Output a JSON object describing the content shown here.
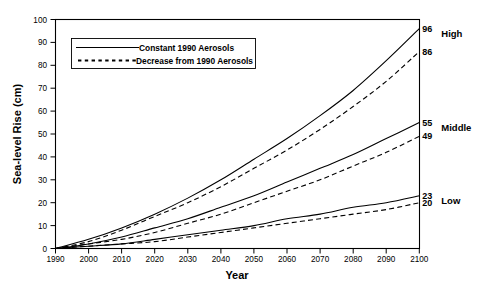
{
  "chart_data": {
    "type": "line",
    "title": "",
    "xlabel": "Year",
    "ylabel": "Sea-level Rise (cm)",
    "xlim": [
      1990,
      2100
    ],
    "ylim": [
      0,
      100
    ],
    "grid": false,
    "legend_position": "upper-left",
    "x": [
      1990,
      2000,
      2010,
      2020,
      2030,
      2040,
      2050,
      2060,
      2070,
      2080,
      2090,
      2100
    ],
    "xticks": [
      "1990",
      "2000",
      "2010",
      "2020",
      "2030",
      "2040",
      "2050",
      "2060",
      "2070",
      "2080",
      "2090",
      "2100"
    ],
    "yticks": [
      "0",
      "10",
      "20",
      "30",
      "40",
      "50",
      "60",
      "70",
      "80",
      "90",
      "100"
    ],
    "series": [
      {
        "name": "High - Constant 1990 Aerosols",
        "scenario": "High",
        "style": "solid",
        "end_value": 96,
        "values": [
          0,
          4,
          9,
          15,
          22,
          30,
          39,
          48,
          58,
          69,
          82,
          96
        ]
      },
      {
        "name": "High - Decrease from 1990 Aerosols",
        "scenario": "High",
        "style": "dashed",
        "end_value": 86,
        "values": [
          0,
          3,
          8,
          14,
          20,
          27,
          35,
          43,
          52,
          62,
          73,
          86
        ]
      },
      {
        "name": "Middle - Constant 1990 Aerosols",
        "scenario": "Middle",
        "style": "solid",
        "end_value": 55,
        "values": [
          0,
          2,
          5,
          9,
          13,
          18,
          23,
          29,
          35,
          41,
          48,
          55
        ]
      },
      {
        "name": "Middle - Decrease from 1990 Aerosols",
        "scenario": "Middle",
        "style": "dashed",
        "end_value": 49,
        "values": [
          0,
          2,
          4,
          7,
          11,
          15,
          20,
          25,
          30,
          36,
          42,
          49
        ]
      },
      {
        "name": "Low - Constant 1990 Aerosols",
        "scenario": "Low",
        "style": "solid",
        "end_value": 23,
        "values": [
          0,
          1,
          2,
          4,
          6,
          8,
          10,
          13,
          15,
          18,
          20,
          23
        ]
      },
      {
        "name": "Low - Decrease from 1990 Aerosols",
        "scenario": "Low",
        "style": "dashed",
        "end_value": 20,
        "values": [
          0,
          1,
          2,
          3,
          5,
          7,
          9,
          11,
          13,
          15,
          17,
          20
        ]
      }
    ],
    "annotations": [
      {
        "label": "High",
        "values": [
          96,
          86
        ]
      },
      {
        "label": "Middle",
        "values": [
          55,
          49
        ]
      },
      {
        "label": "Low",
        "values": [
          23,
          20
        ]
      }
    ],
    "legend": [
      {
        "label": "Constant 1990 Aerosols",
        "style": "solid"
      },
      {
        "label": "Decrease from 1990 Aerosols",
        "style": "dashed"
      }
    ],
    "colors": {
      "line": "#000000",
      "axis": "#000000",
      "background": "#ffffff"
    }
  }
}
